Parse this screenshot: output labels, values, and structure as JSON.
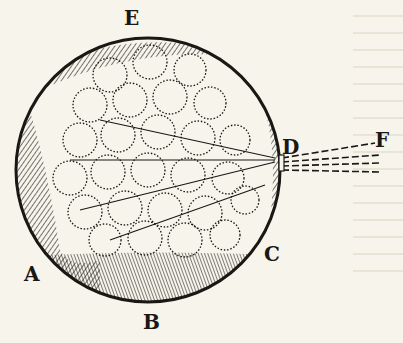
{
  "figure": {
    "labels": {
      "A": "A",
      "B": "B",
      "C": "C",
      "D": "D",
      "E": "E",
      "F": "F"
    },
    "colors": {
      "ink": "#1a1814",
      "paper": "#f7f4ec"
    }
  }
}
